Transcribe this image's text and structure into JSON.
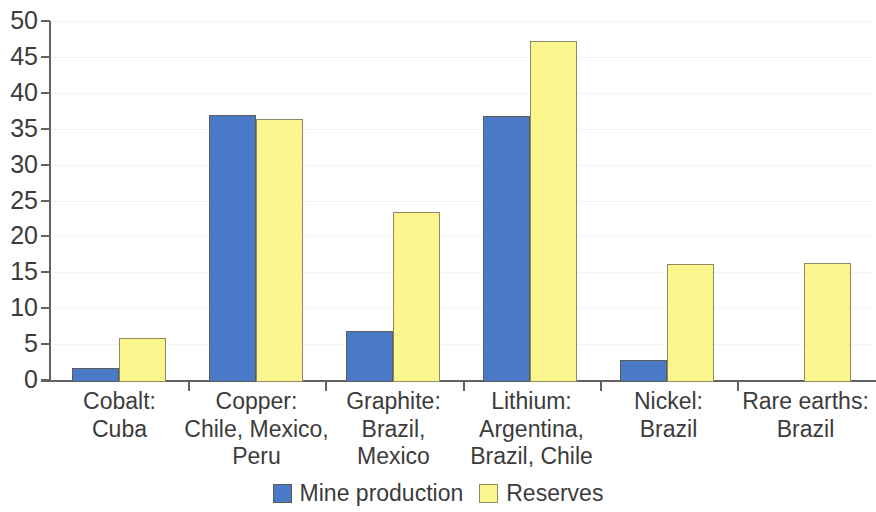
{
  "chart_data": {
    "type": "bar",
    "title": "",
    "subtitle": "",
    "xlabel": "",
    "ylabel": "",
    "ylim": [
      0,
      50
    ],
    "grid": true,
    "legend_position": "bottom-center",
    "categories": [
      "Cobalt:\nCuba",
      "Copper:\nChile, Mexico,\nPeru",
      "Graphite:\nBrazil,\nMexico",
      "Lithium:\nArgentina,\nBrazil, Chile",
      "Nickel:\nBrazil",
      "Rare earths:\nBrazil"
    ],
    "series": [
      {
        "name": "Mine production",
        "color": "#4a79c7",
        "values": [
          2.0,
          37.2,
          7.1,
          37.0,
          3.0,
          0
        ]
      },
      {
        "name": "Reserves",
        "color": "#faf58c",
        "values": [
          6.1,
          36.6,
          23.7,
          47.5,
          16.5,
          16.6
        ]
      }
    ],
    "yticks": [
      0,
      5,
      10,
      15,
      20,
      25,
      30,
      35,
      40,
      45,
      50
    ],
    "ytick_labels": [
      "0",
      "5",
      "10",
      "15",
      "20",
      "25",
      "30",
      "35",
      "40",
      "45",
      "50"
    ]
  },
  "legend": {
    "items": [
      {
        "label": "Mine production",
        "swatch": "mine"
      },
      {
        "label": "Reserves",
        "swatch": "reserves"
      }
    ]
  }
}
